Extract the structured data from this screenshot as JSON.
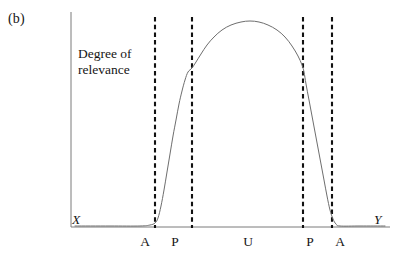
{
  "figure": {
    "panel_label": "(b)",
    "axis_caption_line1": "Degree of",
    "axis_caption_line2": "relevance",
    "x_axis_name": "X",
    "y_axis_name": "Y"
  },
  "colors": {
    "background": "#ffffff",
    "axis": "#7a7a7a",
    "curve": "#6e6e6e",
    "dashed_line": "#111111",
    "text": "#151515"
  },
  "chart_data": {
    "type": "line",
    "title": "",
    "subtitle": "",
    "xlabel": "X",
    "ylabel": "Degree of relevance",
    "grid": false,
    "legend": null,
    "axis": {
      "origin_px": [
        71,
        227
      ],
      "x_end_px": [
        390,
        227
      ],
      "y_top_px": [
        71,
        12
      ],
      "xlim_px": [
        71,
        390
      ],
      "ylim_px": [
        227,
        12
      ]
    },
    "tick_labels": [
      "A",
      "P",
      "U",
      "P",
      "A"
    ],
    "tick_positions_px": [
      145,
      175,
      248,
      310,
      340
    ],
    "annotations": [
      {
        "label": "A",
        "type": "vertical-dashed",
        "x_px": 155
      },
      {
        "label": "P",
        "type": "vertical-dashed",
        "x_px": 192
      },
      {
        "label": "P",
        "type": "vertical-dashed",
        "x_px": 303
      },
      {
        "label": "A",
        "type": "vertical-dashed",
        "x_px": 332
      }
    ],
    "vertical_dashed_lines_px": [
      155,
      192,
      303,
      332
    ],
    "curve_description": "Plateau-shaped membership / relevance curve: flat at zero left of A, rising steeply between A and P, smooth arched plateau across U, falling steeply between P and A on the right, flat at zero beyond.",
    "curve_points_px": [
      [
        75,
        226
      ],
      [
        110,
        226
      ],
      [
        140,
        226
      ],
      [
        150,
        225
      ],
      [
        155,
        223
      ],
      [
        158,
        218
      ],
      [
        161,
        206
      ],
      [
        164,
        190
      ],
      [
        167,
        172
      ],
      [
        170,
        154
      ],
      [
        173,
        136
      ],
      [
        176,
        120
      ],
      [
        179,
        104
      ],
      [
        182,
        91
      ],
      [
        185,
        80
      ],
      [
        188,
        72
      ],
      [
        192,
        68
      ],
      [
        196,
        62
      ],
      [
        201,
        54
      ],
      [
        207,
        45
      ],
      [
        214,
        37
      ],
      [
        222,
        30
      ],
      [
        231,
        25
      ],
      [
        241,
        22
      ],
      [
        250,
        21
      ],
      [
        259,
        22
      ],
      [
        268,
        25
      ],
      [
        277,
        30
      ],
      [
        285,
        37
      ],
      [
        292,
        46
      ],
      [
        298,
        56
      ],
      [
        302,
        65
      ],
      [
        304,
        72
      ],
      [
        306,
        84
      ],
      [
        309,
        100
      ],
      [
        312,
        116
      ],
      [
        315,
        132
      ],
      [
        318,
        148
      ],
      [
        321,
        164
      ],
      [
        324,
        180
      ],
      [
        327,
        196
      ],
      [
        330,
        210
      ],
      [
        333,
        219
      ],
      [
        336,
        224
      ],
      [
        340,
        226
      ],
      [
        360,
        226
      ],
      [
        385,
        226
      ]
    ]
  }
}
